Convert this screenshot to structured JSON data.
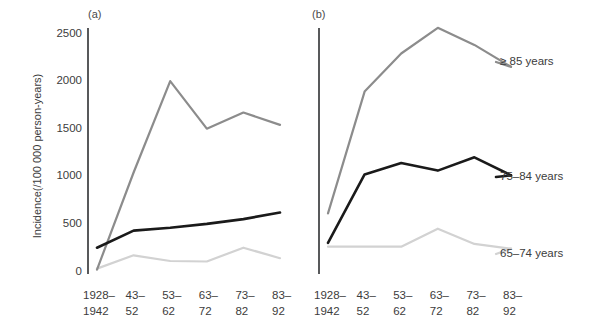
{
  "figure": {
    "panel_a_label": "(a)",
    "panel_b_label": "(b)",
    "y_axis_title": "Incidence(/100 000 person-years)"
  },
  "series_labels": {
    "ge85": "≥ 85 years",
    "a7584": "75–84 years",
    "a6574": "65–74 years"
  },
  "colors": {
    "ge85": "#8c8c8c",
    "a7584": "#1a1a1a",
    "a6574": "#d2d2d2",
    "axis": "#58595b",
    "text": "#3c3c3c"
  },
  "chart_data": [
    {
      "type": "line",
      "title": "(a)",
      "xlabel": "",
      "ylabel": "Incidence(/100 000 person-years)",
      "categories": [
        "1928–1942",
        "43–52",
        "53–62",
        "63–72",
        "73–82",
        "83–92"
      ],
      "category_lines": [
        [
          "1928–",
          "1942"
        ],
        [
          "43–",
          "52"
        ],
        [
          "53–",
          "62"
        ],
        [
          "63–",
          "72"
        ],
        [
          "73–",
          "82"
        ],
        [
          "83–",
          "92"
        ]
      ],
      "yticks": [
        0,
        500,
        1000,
        1500,
        2000,
        2500
      ],
      "ylim": [
        0,
        2500
      ],
      "grid": false,
      "legend_position": "right-of-panel-b",
      "series": [
        {
          "name": "≥ 85 years",
          "color": "#8c8c8c",
          "values": [
            20,
            1040,
            2000,
            1500,
            1670,
            1540
          ]
        },
        {
          "name": "75–84 years",
          "color": "#1a1a1a",
          "values": [
            250,
            430,
            460,
            500,
            550,
            620
          ]
        },
        {
          "name": "65–74 years",
          "color": "#d2d2d2",
          "values": [
            30,
            170,
            110,
            105,
            250,
            140
          ]
        }
      ]
    },
    {
      "type": "line",
      "title": "(b)",
      "xlabel": "",
      "ylabel": "",
      "categories": [
        "1928–1942",
        "43–52",
        "53–62",
        "63–72",
        "73–82",
        "83–92"
      ],
      "category_lines": [
        [
          "1928–",
          "1942"
        ],
        [
          "43–",
          "52"
        ],
        [
          "53–",
          "62"
        ],
        [
          "63–",
          "72"
        ],
        [
          "73–",
          "82"
        ],
        [
          "83–",
          "92"
        ]
      ],
      "yticks": [
        0,
        500,
        1000,
        1500,
        2000,
        2500
      ],
      "ylim": [
        0,
        2500
      ],
      "grid": false,
      "legend_position": "right",
      "series": [
        {
          "name": "≥ 85 years",
          "color": "#8c8c8c",
          "values": [
            610,
            1890,
            2290,
            2560,
            2380,
            2150
          ]
        },
        {
          "name": "75–84 years",
          "color": "#1a1a1a",
          "values": [
            300,
            1020,
            1140,
            1060,
            1200,
            1010
          ]
        },
        {
          "name": "65–74 years",
          "color": "#d2d2d2",
          "values": [
            260,
            260,
            260,
            450,
            290,
            240
          ]
        }
      ]
    }
  ]
}
